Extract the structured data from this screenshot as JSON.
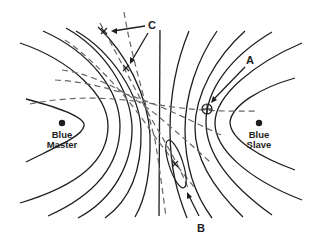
{
  "diagram": {
    "kind": "hyperbolic navigation lines of position",
    "stations": [
      {
        "id": "master",
        "label_line1": "Blue",
        "label_line2": "Master",
        "x": 62,
        "y": 123
      },
      {
        "id": "slave",
        "label_line1": "Blue",
        "label_line2": "Slave",
        "x": 259,
        "y": 123
      }
    ],
    "callouts": {
      "A": {
        "label": "A",
        "meaning": "circled cross fix point"
      },
      "B": {
        "label": "B",
        "meaning": "error ellipse around fix"
      },
      "C": {
        "label": "C",
        "meaning": "two crossing fixes marked with x"
      }
    },
    "colors": {
      "solid_line": "#1e1e1e",
      "dashed_line": "#666666",
      "background": "#ffffff"
    }
  }
}
